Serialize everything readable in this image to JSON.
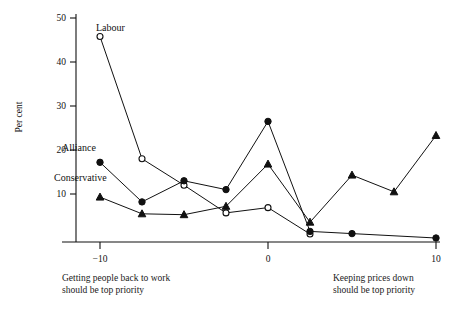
{
  "chart_data": {
    "type": "line",
    "title": "",
    "xlabel": "",
    "ylabel": "Per cent",
    "xlim": [
      -11.5,
      10.5
    ],
    "ylim": [
      -0.9,
      50
    ],
    "grid": false,
    "legend_position": "inline-labels",
    "x_ticks": [
      -10,
      0,
      10
    ],
    "x_tick_labels": [
      "−10",
      "0",
      "10"
    ],
    "y_ticks": [
      10,
      20,
      30,
      40,
      50
    ],
    "y_tick_labels": [
      "10",
      "20",
      "30",
      "40",
      "50"
    ],
    "axis_caption_left": "Getting people back to work\nshould be top priority",
    "axis_caption_right": "Keeping prices down\nshould be top priority",
    "series": [
      {
        "name": "Labour",
        "marker": "open-circle",
        "label_text": "Labour",
        "x": [
          -10,
          -7.5,
          -5,
          -2.5,
          0,
          2.5
        ],
        "values": [
          45.8,
          18.0,
          12.0,
          5.7,
          6.9,
          0.9
        ]
      },
      {
        "name": "Alliance",
        "marker": "filled-circle",
        "label_text": "Alliance",
        "x": [
          -10,
          -7.5,
          -5,
          -2.5,
          0,
          2.5,
          5,
          10
        ],
        "values": [
          17.2,
          8.2,
          13.0,
          11.0,
          26.5,
          1.5,
          1.0,
          0.0
        ]
      },
      {
        "name": "Conservative",
        "marker": "filled-triangle",
        "label_text": "Conservative",
        "x": [
          -10,
          -7.5,
          -5,
          -2.5,
          0,
          2.5,
          5,
          7.5,
          10
        ],
        "values": [
          9.3,
          5.5,
          5.3,
          7.2,
          16.8,
          3.6,
          14.3,
          10.5,
          23.3
        ]
      }
    ]
  }
}
